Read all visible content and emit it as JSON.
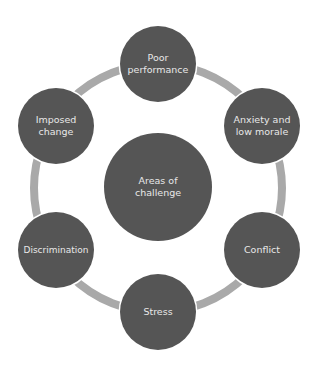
{
  "diagram": {
    "type": "cycle",
    "colors": {
      "node_fill": "#555555",
      "ring": "#a9a9a9",
      "text": "#e8e8e8"
    },
    "center": {
      "label": "Areas of\nchallenge"
    },
    "nodes": [
      {
        "label": "Poor\nperformance"
      },
      {
        "label": "Anxiety and\nlow morale"
      },
      {
        "label": "Conflict"
      },
      {
        "label": "Stress"
      },
      {
        "label": "Discrimination"
      },
      {
        "label": "Imposed\nchange"
      }
    ]
  }
}
